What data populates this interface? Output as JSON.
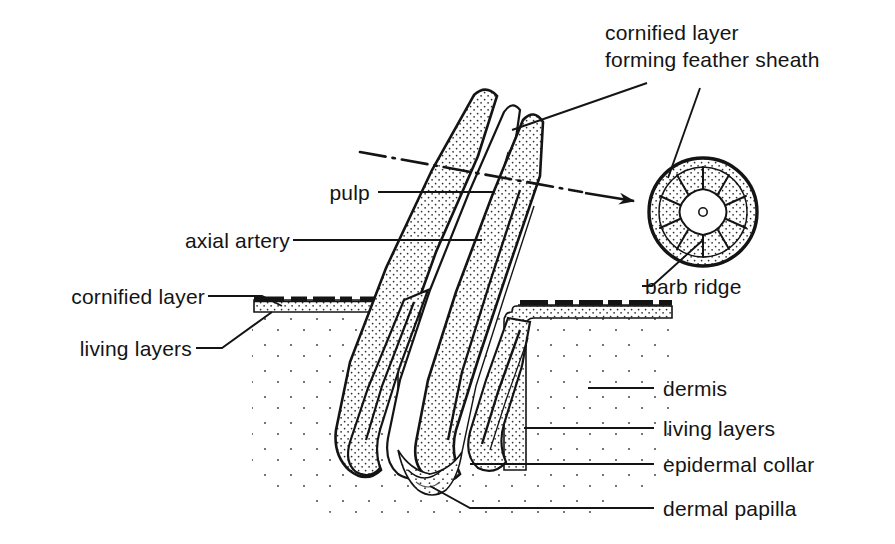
{
  "figure": {
    "type": "anatomical-diagram",
    "background_color": "#ffffff",
    "ink_color": "#141414"
  },
  "labels": {
    "sheath_line1": "cornified layer",
    "sheath_line2": "forming feather sheath",
    "pulp": "pulp",
    "axial_artery": "axial artery",
    "cornified_layer": "cornified layer",
    "living_layers_left": "living layers",
    "barb_ridge": "barb ridge",
    "dermis": "dermis",
    "living_layers_right": "living layers",
    "epidermal_collar": "epidermal collar",
    "dermal_papilla": "dermal papilla"
  },
  "inset": {
    "description": "transverse section of feather germ",
    "barb_ridge_count": 10,
    "has_central_pulp_cavity": true,
    "has_axial_artery_dot": true
  },
  "section_indicator": {
    "style": "dash-dot line with arrowhead",
    "direction": "right"
  }
}
